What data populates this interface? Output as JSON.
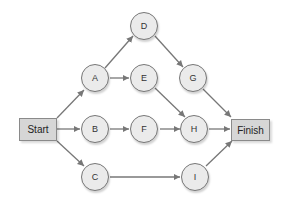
{
  "diagram": {
    "type": "network-diagram",
    "colors": {
      "node_fill": "#ebebeb",
      "node_border": "#777777",
      "box_fill": "#d6d6d6",
      "edge": "#777777"
    },
    "terminals": {
      "start": {
        "label": "Start"
      },
      "finish": {
        "label": "Finish"
      }
    },
    "nodes": {
      "A": {
        "label": "A"
      },
      "B": {
        "label": "B"
      },
      "C": {
        "label": "C"
      },
      "D": {
        "label": "D"
      },
      "E": {
        "label": "E"
      },
      "F": {
        "label": "F"
      },
      "G": {
        "label": "G"
      },
      "H": {
        "label": "H"
      },
      "I": {
        "label": "I"
      }
    },
    "edges": [
      [
        "Start",
        "A"
      ],
      [
        "Start",
        "B"
      ],
      [
        "Start",
        "C"
      ],
      [
        "A",
        "D"
      ],
      [
        "A",
        "E"
      ],
      [
        "B",
        "F"
      ],
      [
        "D",
        "G"
      ],
      [
        "E",
        "H"
      ],
      [
        "F",
        "H"
      ],
      [
        "C",
        "I"
      ],
      [
        "G",
        "Finish"
      ],
      [
        "H",
        "Finish"
      ],
      [
        "I",
        "Finish"
      ]
    ]
  }
}
